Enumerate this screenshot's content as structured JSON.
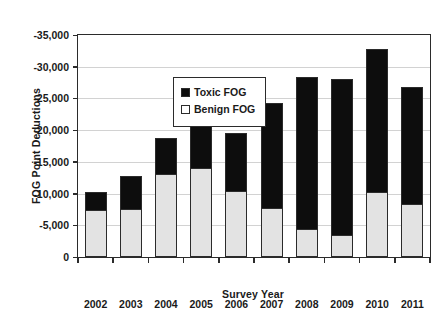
{
  "chart_data": {
    "type": "bar",
    "stacked": true,
    "title": "",
    "xlabel": "Survey Year",
    "ylabel": "FOG Point Deductions",
    "categories": [
      "2002",
      "2003",
      "2004",
      "2005",
      "2006",
      "2007",
      "2008",
      "2009",
      "2010",
      "2011"
    ],
    "series": [
      {
        "name": "Benign FOG",
        "color": "#e3e3e3",
        "values": [
          -7400,
          -7500,
          -13100,
          -14000,
          -10400,
          -7800,
          -4400,
          -3500,
          -10200,
          -8400
        ]
      },
      {
        "name": "Toxic FOG",
        "color": "#0d0d0d",
        "values": [
          -3000,
          -5500,
          -5900,
          -7000,
          -9300,
          -16600,
          -24100,
          -24700,
          -22800,
          -18600
        ]
      }
    ],
    "totals": [
      -10400,
      -13000,
      -19000,
      -21000,
      -19700,
      -24400,
      -28500,
      -28200,
      -33000,
      -27000
    ],
    "ylim": [
      0,
      -35000
    ],
    "y_ticks": [
      0,
      -5000,
      -10000,
      -15000,
      -20000,
      -25000,
      -30000,
      -35000
    ],
    "y_tick_labels": [
      "0",
      "-5,000",
      "-10,000",
      "-15,000",
      "-20,000",
      "-25,000",
      "-30,000",
      "-35,000"
    ],
    "y_axis_inverted": true,
    "grid": true,
    "legend_position": "upper-left",
    "legend_entries": [
      {
        "label": "Toxic FOG",
        "swatch": "filled-black-square"
      },
      {
        "label": "Benign FOG",
        "swatch": "open-white-square"
      }
    ]
  }
}
